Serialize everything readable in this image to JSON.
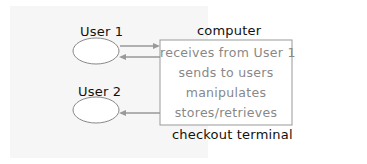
{
  "diagram": {
    "actors": [
      {
        "label": "User 1"
      },
      {
        "label": "User 2"
      }
    ],
    "system": {
      "title": "computer",
      "functions": [
        "receives from User 1",
        "sends to users",
        "manipulates",
        "stores/retrieves"
      ],
      "caption": "checkout terminal"
    },
    "arrows": [
      {
        "from": "User 1",
        "to": "computer"
      },
      {
        "from": "computer",
        "to": "User 1"
      },
      {
        "from": "computer",
        "to": "User 2"
      }
    ],
    "colors": {
      "background": "#f6f6f6",
      "line": "#999999",
      "text": "#111111",
      "box_text": "#888888"
    }
  }
}
